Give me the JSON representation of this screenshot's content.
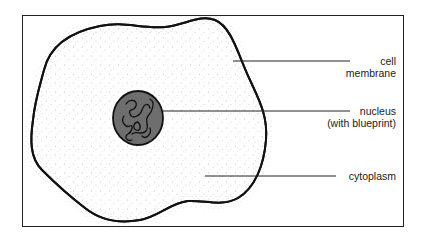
{
  "diagram": {
    "type": "cell schematic",
    "parts": [
      {
        "id": "cell-membrane",
        "label_line1": "cell",
        "label_line2": "membrane"
      },
      {
        "id": "nucleus",
        "label_line1": "nucleus",
        "label_line2": "(with blueprint)"
      },
      {
        "id": "cytoplasm",
        "label_line1": "cytoplasm"
      }
    ]
  },
  "labels": {
    "membrane_1": "cell",
    "membrane_2": "membrane",
    "nucleus_1": "nucleus",
    "nucleus_2": "(with blueprint)",
    "cytoplasm": "cytoplasm"
  },
  "colors": {
    "outline": "#111111",
    "nucleus_fill": "#6e6e6e",
    "background": "#ffffff"
  }
}
